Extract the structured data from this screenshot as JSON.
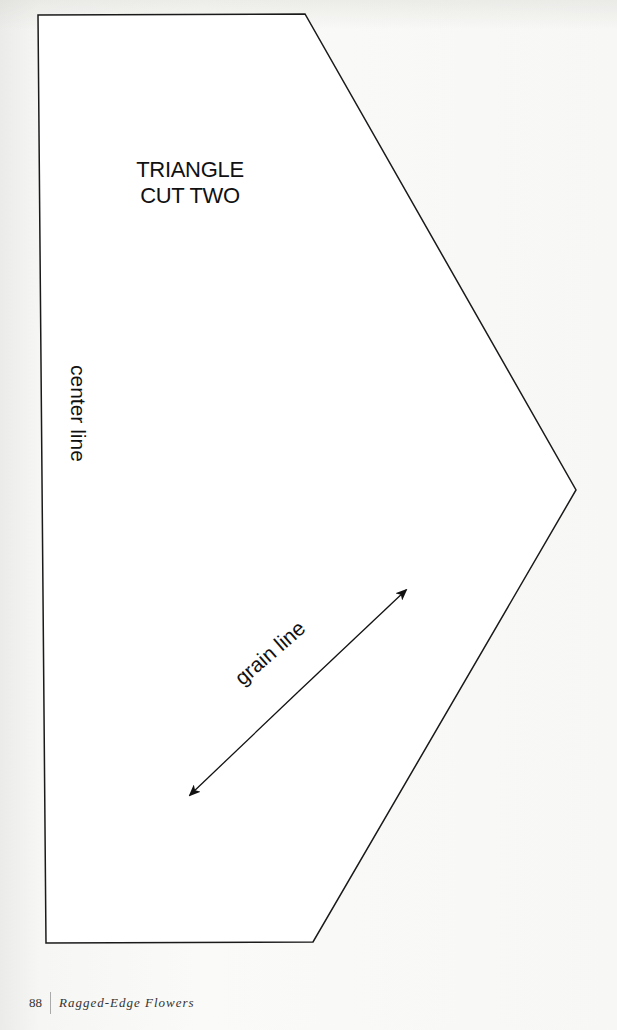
{
  "pattern": {
    "title_line1": "TRIANGLE",
    "title_line2": "CUT TWO",
    "center_line_label": "center line",
    "grain_line_label": "grain line",
    "outline_color": "#1a1a1a",
    "vertices": [
      [
        38,
        15
      ],
      [
        305,
        14
      ],
      [
        576,
        490
      ],
      [
        313,
        942
      ],
      [
        46,
        943
      ]
    ],
    "grain_arrow": {
      "from": [
        190,
        795
      ],
      "to": [
        406,
        590
      ]
    }
  },
  "footer": {
    "page_number": "88",
    "book_title": "Ragged-Edge Flowers"
  }
}
